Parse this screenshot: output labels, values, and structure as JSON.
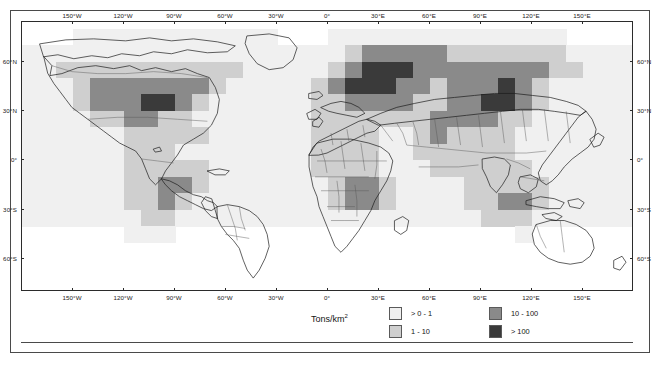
{
  "figure": {
    "type": "choropleth-grid-world-map",
    "background": "#ffffff",
    "frame_color": "#4a4a4a"
  },
  "axes": {
    "longitude_ticks": [
      "150°W",
      "120°W",
      "90°W",
      "60°W",
      "30°W",
      "0°",
      "30°E",
      "60°E",
      "90°E",
      "120°E",
      "150°E"
    ],
    "longitude_values": [
      -150,
      -120,
      -90,
      -60,
      -30,
      0,
      30,
      60,
      90,
      120,
      150
    ],
    "latitude_ticks": [
      "60°N",
      "30°N",
      "0°",
      "30°S",
      "60°S"
    ],
    "latitude_values": [
      60,
      30,
      0,
      -30,
      -60
    ],
    "xlim": [
      -180,
      180
    ],
    "ylim": [
      -80,
      84
    ],
    "grid": false
  },
  "legend": {
    "title": "Tons/km",
    "title_superscript": "2",
    "position": "bottom-center",
    "entries": [
      {
        "label": "> 0 - 1",
        "color": "#f0f0f0",
        "range": [
          0,
          1
        ]
      },
      {
        "label": "1 - 10",
        "color": "#cfcfcf",
        "range": [
          1,
          10
        ]
      },
      {
        "label": "10 - 100",
        "color": "#8a8a8a",
        "range": [
          10,
          100
        ]
      },
      {
        "label": "> 100",
        "color": "#3a3a3a",
        "range": [
          100,
          null
        ]
      }
    ]
  },
  "chart_data": {
    "type": "heatmap",
    "title": "",
    "subtitle": "",
    "xlabel": "",
    "ylabel": "",
    "unit": "Tons/km²",
    "projection": "equirectangular",
    "cell_size_degrees": 10,
    "class_colors": [
      "#ffffff",
      "#f0f0f0",
      "#cfcfcf",
      "#8a8a8a",
      "#3a3a3a"
    ],
    "class_labels": [
      "no data",
      "> 0 - 1",
      "1 - 10",
      "10 - 100",
      "> 100"
    ],
    "legend_position": "bottom-center",
    "grid_origin": {
      "lon": -180,
      "lat": 80
    },
    "note": "rows run north to south at 10-degree steps from 80N; each row is 36 values (one per 10-degree longitude band starting at 180W); value = class index into class_labels",
    "rows": [
      {
        "lat": 80,
        "values": [
          0,
          0,
          0,
          0,
          0,
          0,
          0,
          0,
          0,
          0,
          0,
          0,
          0,
          0,
          0,
          0,
          0,
          0,
          0,
          0,
          0,
          0,
          0,
          0,
          0,
          0,
          0,
          0,
          0,
          0,
          0,
          0,
          0,
          0,
          0,
          0
        ]
      },
      {
        "lat": 70,
        "values": [
          0,
          0,
          0,
          1,
          1,
          1,
          1,
          1,
          1,
          1,
          1,
          1,
          1,
          1,
          1,
          0,
          0,
          0,
          1,
          1,
          1,
          1,
          1,
          1,
          1,
          1,
          1,
          1,
          1,
          1,
          1,
          1,
          0,
          0,
          0,
          0
        ]
      },
      {
        "lat": 60,
        "values": [
          1,
          1,
          1,
          1,
          1,
          1,
          1,
          1,
          1,
          1,
          1,
          1,
          1,
          1,
          1,
          1,
          1,
          1,
          1,
          2,
          3,
          3,
          3,
          3,
          3,
          2,
          2,
          2,
          2,
          2,
          2,
          2,
          1,
          1,
          1,
          1
        ]
      },
      {
        "lat": 50,
        "values": [
          1,
          1,
          2,
          2,
          2,
          2,
          2,
          2,
          2,
          2,
          2,
          2,
          2,
          1,
          1,
          1,
          1,
          1,
          2,
          3,
          4,
          4,
          4,
          3,
          3,
          3,
          3,
          3,
          3,
          3,
          3,
          2,
          2,
          1,
          1,
          1
        ]
      },
      {
        "lat": 40,
        "values": [
          1,
          1,
          1,
          2,
          3,
          3,
          3,
          3,
          3,
          3,
          3,
          2,
          1,
          1,
          1,
          1,
          1,
          2,
          3,
          4,
          4,
          4,
          3,
          3,
          2,
          3,
          3,
          3,
          4,
          3,
          2,
          1,
          1,
          1,
          1,
          1
        ]
      },
      {
        "lat": 30,
        "values": [
          1,
          1,
          1,
          2,
          3,
          3,
          3,
          4,
          4,
          3,
          2,
          1,
          1,
          1,
          1,
          1,
          1,
          2,
          2,
          3,
          3,
          3,
          3,
          2,
          2,
          3,
          3,
          4,
          4,
          3,
          2,
          1,
          1,
          1,
          1,
          1
        ]
      },
      {
        "lat": 20,
        "values": [
          1,
          1,
          1,
          1,
          2,
          2,
          3,
          3,
          2,
          2,
          1,
          1,
          1,
          1,
          1,
          1,
          1,
          2,
          2,
          2,
          2,
          2,
          2,
          2,
          3,
          3,
          3,
          3,
          2,
          2,
          1,
          1,
          1,
          1,
          1,
          1
        ]
      },
      {
        "lat": 10,
        "values": [
          1,
          1,
          1,
          1,
          1,
          1,
          2,
          2,
          2,
          2,
          2,
          1,
          1,
          1,
          1,
          1,
          1,
          2,
          2,
          2,
          2,
          1,
          1,
          2,
          3,
          2,
          2,
          2,
          2,
          1,
          1,
          1,
          1,
          1,
          1,
          1
        ]
      },
      {
        "lat": 0,
        "values": [
          1,
          1,
          1,
          1,
          1,
          1,
          2,
          2,
          2,
          1,
          1,
          1,
          1,
          1,
          1,
          1,
          1,
          2,
          2,
          2,
          2,
          1,
          1,
          2,
          2,
          2,
          2,
          2,
          2,
          1,
          1,
          1,
          1,
          1,
          1,
          1
        ]
      },
      {
        "lat": -10,
        "values": [
          1,
          1,
          1,
          1,
          1,
          1,
          2,
          2,
          2,
          2,
          2,
          1,
          1,
          1,
          1,
          1,
          1,
          2,
          2,
          2,
          2,
          1,
          1,
          1,
          2,
          2,
          2,
          2,
          2,
          2,
          1,
          1,
          1,
          1,
          1,
          1
        ]
      },
      {
        "lat": -20,
        "values": [
          1,
          1,
          1,
          1,
          1,
          1,
          2,
          2,
          3,
          3,
          2,
          1,
          1,
          1,
          1,
          1,
          1,
          1,
          2,
          3,
          3,
          2,
          1,
          1,
          1,
          1,
          2,
          2,
          2,
          2,
          2,
          1,
          1,
          1,
          1,
          1
        ]
      },
      {
        "lat": -30,
        "values": [
          1,
          1,
          1,
          1,
          1,
          1,
          2,
          2,
          3,
          2,
          1,
          1,
          1,
          1,
          1,
          1,
          1,
          1,
          2,
          3,
          3,
          2,
          1,
          1,
          1,
          1,
          2,
          2,
          3,
          3,
          2,
          1,
          1,
          1,
          1,
          1
        ]
      },
      {
        "lat": -40,
        "values": [
          1,
          1,
          1,
          1,
          1,
          1,
          1,
          2,
          2,
          1,
          1,
          1,
          1,
          1,
          1,
          1,
          1,
          1,
          1,
          1,
          1,
          1,
          1,
          1,
          1,
          1,
          1,
          2,
          2,
          2,
          1,
          1,
          1,
          1,
          1,
          1
        ]
      },
      {
        "lat": -50,
        "values": [
          0,
          0,
          0,
          0,
          0,
          0,
          1,
          1,
          1,
          0,
          0,
          0,
          0,
          0,
          0,
          0,
          0,
          0,
          0,
          0,
          0,
          0,
          0,
          0,
          0,
          0,
          0,
          0,
          0,
          1,
          0,
          0,
          0,
          0,
          0,
          0
        ]
      },
      {
        "lat": -60,
        "values": [
          0,
          0,
          0,
          0,
          0,
          0,
          0,
          0,
          0,
          0,
          0,
          0,
          0,
          0,
          0,
          0,
          0,
          0,
          0,
          0,
          0,
          0,
          0,
          0,
          0,
          0,
          0,
          0,
          0,
          0,
          0,
          0,
          0,
          0,
          0,
          0
        ]
      },
      {
        "lat": -70,
        "values": [
          0,
          0,
          0,
          0,
          0,
          0,
          0,
          0,
          0,
          0,
          0,
          0,
          0,
          0,
          0,
          0,
          0,
          0,
          0,
          0,
          0,
          0,
          0,
          0,
          0,
          0,
          0,
          0,
          0,
          0,
          0,
          0,
          0,
          0,
          0,
          0
        ]
      }
    ]
  }
}
